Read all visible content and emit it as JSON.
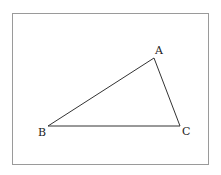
{
  "diagram": {
    "type": "triangle",
    "vertices": [
      {
        "label": "A",
        "x": 154,
        "y": 58,
        "label_x": 155,
        "label_y": 54
      },
      {
        "label": "B",
        "x": 48,
        "y": 126,
        "label_x": 38,
        "label_y": 136
      },
      {
        "label": "C",
        "x": 180,
        "y": 126,
        "label_x": 182,
        "label_y": 135
      }
    ],
    "edges": [
      [
        "A",
        "B"
      ],
      [
        "B",
        "C"
      ],
      [
        "C",
        "A"
      ]
    ],
    "stroke_color": "#333333",
    "frame_color": "#9a9a9a"
  }
}
